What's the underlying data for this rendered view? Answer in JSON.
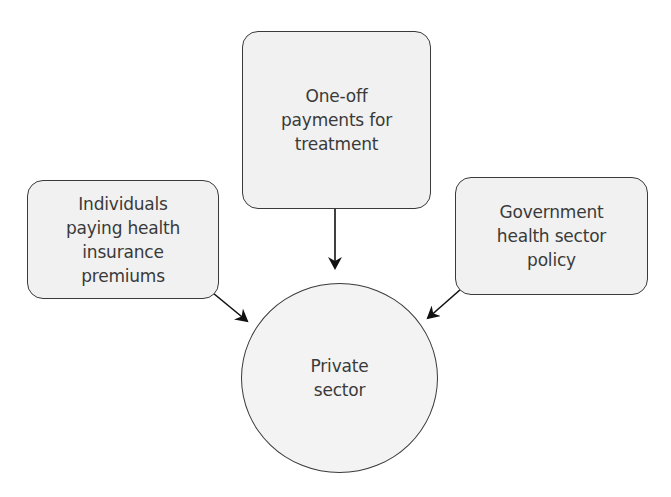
{
  "diagram": {
    "type": "flow-into-center",
    "colors": {
      "node_fill": "#f1f1f1",
      "node_border": "#3a3a3a",
      "text": "#3a3a3a",
      "arrow": "#111111",
      "background": "#ffffff"
    },
    "nodes": {
      "top": {
        "shape": "rounded-rectangle",
        "label": "One-off\npayments for\ntreatment"
      },
      "left": {
        "shape": "rounded-rectangle",
        "label": "Individuals\npaying health\ninsurance\npremiums"
      },
      "right": {
        "shape": "rounded-rectangle",
        "label": "Government\nhealth sector\npolicy"
      },
      "center": {
        "shape": "circle",
        "label": "Private\nsector"
      }
    },
    "edges": [
      {
        "from": "top",
        "to": "center",
        "direction": "down"
      },
      {
        "from": "left",
        "to": "center",
        "direction": "down-right"
      },
      {
        "from": "right",
        "to": "center",
        "direction": "down-left"
      }
    ]
  }
}
